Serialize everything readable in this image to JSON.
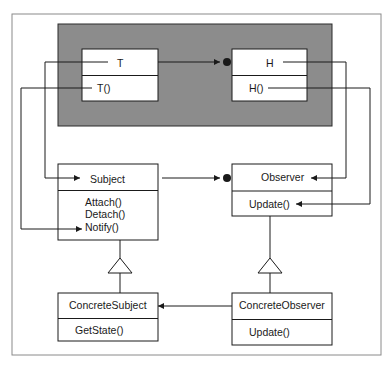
{
  "diagram": {
    "type": "uml-class-diagram",
    "colors": {
      "background": "#ffffff",
      "frame": "#8a8a8a",
      "group_fill": "#8c8c8c",
      "group_border": "#2a2a2a",
      "box_fill": "#ffffff",
      "line": "#1a1a1a"
    },
    "group": {
      "name": "instance-layer"
    },
    "classes": {
      "t": {
        "name": "T",
        "methods": [
          "T()"
        ]
      },
      "h": {
        "name": "H",
        "methods": [
          "H()"
        ]
      },
      "subject": {
        "name": "Subject",
        "methods": [
          "Attach()",
          "Detach()",
          "Notify()"
        ]
      },
      "observer": {
        "name": "Observer",
        "methods": [
          "Update()"
        ]
      },
      "concrete_subject": {
        "name": "ConcreteSubject",
        "methods": [
          "GetState()"
        ]
      },
      "concrete_observer": {
        "name": "ConcreteObserver",
        "methods": [
          "Update()"
        ]
      }
    },
    "relations": [
      {
        "from": "T",
        "to": "H",
        "kind": "association-arrow-with-dot"
      },
      {
        "from": "Subject",
        "to": "Observer",
        "kind": "association-arrow-with-dot"
      },
      {
        "from": "ConcreteObserver",
        "to": "ConcreteSubject",
        "kind": "association-arrow"
      },
      {
        "from": "ConcreteSubject",
        "to": "Subject",
        "kind": "inheritance"
      },
      {
        "from": "ConcreteObserver",
        "to": "Observer",
        "kind": "inheritance"
      },
      {
        "from": "T",
        "to": "Subject",
        "kind": "mapping-arrow"
      },
      {
        "from": "T()",
        "to": "Notify()",
        "kind": "mapping-arrow"
      },
      {
        "from": "H",
        "to": "Observer",
        "kind": "mapping-arrow"
      },
      {
        "from": "H()",
        "to": "Update()",
        "kind": "mapping-arrow"
      }
    ]
  }
}
